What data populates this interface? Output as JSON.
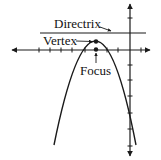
{
  "labels": {
    "directrix": "Directrix",
    "vertex": "Vertex",
    "focus": "Focus"
  },
  "colors": {
    "stroke": "#1a1a1a",
    "background": "#ffffff"
  },
  "figure": {
    "type": "parabola",
    "opens": "down",
    "elements": [
      "x-axis",
      "y-axis",
      "directrix",
      "vertex",
      "focus",
      "parabola"
    ]
  }
}
